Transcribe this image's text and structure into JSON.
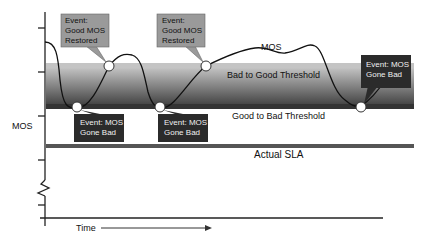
{
  "diagram": {
    "y_axis_label": "MOS",
    "x_axis_label": "Time",
    "curve_label": "MOS",
    "bands": {
      "bad_to_good": "Bad to Good Threshold",
      "good_to_bad": "Good to Bad Threshold",
      "actual_sla": "Actual SLA"
    },
    "callouts": {
      "restored_1": [
        "Event:",
        "Good MOS",
        "Restored"
      ],
      "restored_2": [
        "Event:",
        "Good MOS",
        "Restored"
      ],
      "bad_1": [
        "Event: MOS",
        "Gone Bad"
      ],
      "bad_2": [
        "Event: MOS",
        "Gone Bad"
      ],
      "bad_3": [
        "Event: MOS",
        "Gone Bad"
      ]
    },
    "colors": {
      "axis": "#222222",
      "curve": "#111111",
      "band_top": "#c8c8c8",
      "band_bottom": "#3a3a3a",
      "threshold_line": "#333333",
      "sla_line": "#555555",
      "restored_box": "#9a9a9a",
      "bad_box": "#2b2b2b"
    }
  }
}
